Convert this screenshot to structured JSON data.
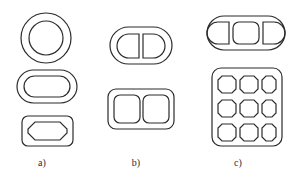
{
  "figure": {
    "top_fragment": "",
    "background_color": "#ffffff",
    "line_color": "#2b2b2b",
    "groups": [
      {
        "id": "group-a",
        "label": "a)",
        "label_x": 42,
        "label_y": 166,
        "description": "single-cell profiles",
        "shapes": [
          {
            "name": "annulus-circle",
            "outline": "circle",
            "inner": "circle",
            "cells": 1
          },
          {
            "name": "stadium-in-stadium",
            "outline": "stadium",
            "inner": "stadium",
            "cells": 1
          },
          {
            "name": "octagon-in-rounded-rect",
            "outline": "rounded-rect",
            "inner": "octagon",
            "cells": 1
          }
        ]
      },
      {
        "id": "group-b",
        "label": "b)",
        "label_x": 136,
        "label_y": 166,
        "description": "two-cell profiles",
        "shapes": [
          {
            "name": "two-d-cells-in-stadium",
            "outline": "stadium",
            "inner": "two-d-cells",
            "cells": 2
          },
          {
            "name": "two-rounded-cells-in-rounded-rect",
            "outline": "rounded-rect",
            "inner": "two-rounded-squares",
            "cells": 2
          }
        ]
      },
      {
        "id": "group-c",
        "label": "c)",
        "label_x": 238,
        "label_y": 166,
        "description": "multi-cell profiles",
        "shapes": [
          {
            "name": "three-cells-in-stadium",
            "outline": "stadium",
            "inner": "three-cells",
            "cells": 3
          },
          {
            "name": "nine-cell-grid-in-rounded-rect",
            "outline": "rounded-rect",
            "inner": "three-by-three-grid",
            "cells": 9,
            "grid_rows": 3,
            "grid_cols": 3
          }
        ]
      }
    ]
  }
}
